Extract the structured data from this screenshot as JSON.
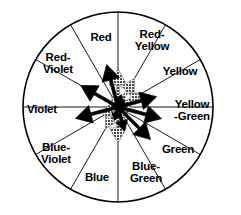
{
  "figure": {
    "name": "color-wheel-star-diagram",
    "title": "",
    "background_color": "#ffffff",
    "outline_color": "#000000"
  },
  "wheel": {
    "center_x": 118,
    "center_y": 107,
    "radius": 95,
    "sector_count": 12,
    "sector_span_degrees": 30,
    "stroke_color": "#000000",
    "outer_stroke_width": 1.6,
    "spoke_stroke_width": 0.9,
    "sectors": [
      {
        "name": "red-yellow",
        "label": "Red-\nYellow",
        "label_line1": "Red-",
        "label_line2": "Yellow",
        "angle_deg": 75,
        "label_x": 152,
        "label_y": 40
      },
      {
        "name": "yellow",
        "label": "Yellow",
        "label_line1": "Yellow",
        "label_line2": "",
        "angle_deg": 45,
        "label_x": 180,
        "label_y": 72
      },
      {
        "name": "yellow-green",
        "label": "Yellow\n-Green",
        "label_line1": "Yellow",
        "label_line2": "-Green",
        "angle_deg": 15,
        "label_x": 192,
        "label_y": 110
      },
      {
        "name": "green",
        "label": "Green",
        "label_line1": "Green",
        "label_line2": "",
        "angle_deg": -15,
        "label_x": 178,
        "label_y": 150
      },
      {
        "name": "blue-green",
        "label": "Blue-\nGreen",
        "label_line1": "Blue-",
        "label_line2": "Green",
        "angle_deg": -45,
        "label_x": 146,
        "label_y": 172
      },
      {
        "name": "blue",
        "label": "Blue",
        "label_line1": "Blue",
        "label_line2": "",
        "angle_deg": -75,
        "label_x": 97,
        "label_y": 178
      },
      {
        "name": "blue-violet",
        "label": "Blue-\nViolet",
        "label_line1": "Blue-",
        "label_line2": "Violet",
        "angle_deg": 255,
        "label_x": 56,
        "label_y": 153
      },
      {
        "name": "violet",
        "label": "Violet",
        "label_line1": "Violet",
        "label_line2": "",
        "angle_deg": 195,
        "label_x": 42,
        "label_y": 110
      },
      {
        "name": "red-violet",
        "label": "Red-\nViolet",
        "label_line1": "Red-",
        "label_line2": "Violet",
        "angle_deg": 150,
        "label_x": 58,
        "label_y": 63
      },
      {
        "name": "red",
        "label": "Red",
        "label_line1": "Red",
        "label_line2": "",
        "angle_deg": 105,
        "label_x": 101,
        "label_y": 38
      }
    ]
  },
  "star_plot": {
    "description": "radial star / arrow diagram over the twelve hue directions",
    "spoke_count": 12,
    "series": [
      {
        "name": "black-arrows",
        "color": "#000000",
        "style": "solid",
        "directions_deg": [
          105,
          75,
          45,
          15,
          -15,
          -45,
          -75,
          255,
          195,
          150
        ],
        "lengths": [
          44,
          13,
          10,
          40,
          45,
          46,
          25,
          14,
          44,
          43
        ]
      },
      {
        "name": "gray-arrows",
        "color": "#878787",
        "style": "halftone",
        "directions_deg": [
          90,
          60,
          30,
          0,
          -30,
          -60,
          -90,
          240,
          210,
          180,
          120
        ],
        "lengths": [
          38,
          33,
          28,
          14,
          13,
          13,
          36,
          25,
          18,
          12,
          12
        ]
      }
    ]
  },
  "chart_data": {
    "type": "radar",
    "title": "",
    "categories": [
      "Red",
      "Red-Yellow",
      "Yellow",
      "Yellow-Green",
      "Green",
      "Blue-Green",
      "Blue",
      "Blue-Violet",
      "Violet",
      "Red-Violet"
    ],
    "series": [
      {
        "name": "black-arrows",
        "values": [
          44,
          13,
          10,
          40,
          45,
          46,
          25,
          14,
          44,
          43
        ]
      },
      {
        "name": "gray-arrows",
        "values": [
          38,
          28,
          14,
          13,
          13,
          36,
          25,
          18,
          12,
          33
        ]
      }
    ],
    "legend": "none",
    "grid": false
  }
}
